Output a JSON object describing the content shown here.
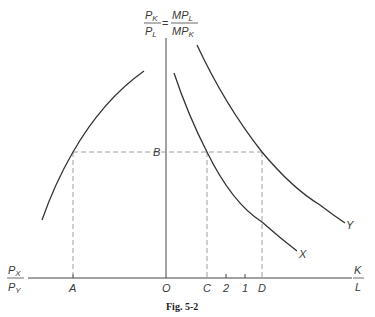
{
  "figure": {
    "caption": "Fig. 5-2",
    "y_axis_label": {
      "lhs_num": "P",
      "lhs_num_sub": "K",
      "lhs_den": "P",
      "lhs_den_sub": "L",
      "eq": "=",
      "rhs_num": "MP",
      "rhs_num_sub": "L",
      "rhs_den": "MP",
      "rhs_den_sub": "K"
    },
    "x_axis_right_label": {
      "num": "K",
      "den": "L"
    },
    "x_axis_left_label": {
      "num": "P",
      "num_sub": "X",
      "den": "P",
      "den_sub": "Y"
    },
    "points": {
      "origin": "O",
      "A": "A",
      "B": "B",
      "C": "C",
      "D": "D",
      "tick_2": "2",
      "tick_1": "1"
    },
    "curves": {
      "X": "X",
      "Y": "Y"
    }
  }
}
